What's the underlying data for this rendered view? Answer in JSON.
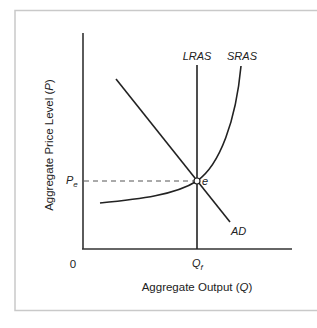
{
  "diagram": {
    "type": "AD-AS model (long-run equilibrium)",
    "axes": {
      "y_label": "Aggregate Price Level (",
      "y_var": "P",
      "y_label_close": ")",
      "x_label": "Aggregate Output (",
      "x_var": "Q",
      "x_label_close": ")",
      "origin_label": "0"
    },
    "curves": {
      "lras": "LRAS",
      "sras": "SRAS",
      "ad": "AD"
    },
    "equilibrium": {
      "point_label": "e",
      "price_label_main": "P",
      "price_label_sub": "e",
      "output_label_main": "Q",
      "output_label_sub": "f"
    },
    "colors": {
      "line": "#222222",
      "frame": "#c9c9c9"
    }
  }
}
